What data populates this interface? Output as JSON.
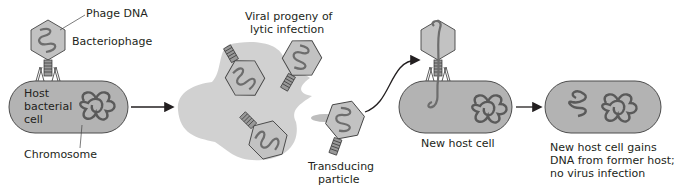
{
  "diagram": {
    "colors": {
      "cell_fill": "#b3b3b3",
      "cell_stroke": "#4d4d4d",
      "capsid_fill": "#c2c2c2",
      "dna": "#6d6d6d",
      "chromosome": "#5a5a5a",
      "arrow": "#231f20",
      "debris": "#d4d4d4"
    },
    "panel1": {
      "phage_dna_label": "Phage DNA",
      "bacteriophage_label": "Bacteriophage",
      "host_label_line1": "Host",
      "host_label_line2": "bacterial",
      "host_label_line3": "cell",
      "chromosome_label": "Chromosome"
    },
    "panel2": {
      "progeny_label_line1": "Viral progeny of",
      "progeny_label_line2": "lytic infection",
      "transducing_label_line1": "Transducing",
      "transducing_label_line2": "particle"
    },
    "panel3": {
      "new_host_label": "New host cell"
    },
    "panel4": {
      "result_label_line1": "New host cell gains",
      "result_label_line2": "DNA from former host;",
      "result_label_line3": "no virus infection"
    }
  }
}
